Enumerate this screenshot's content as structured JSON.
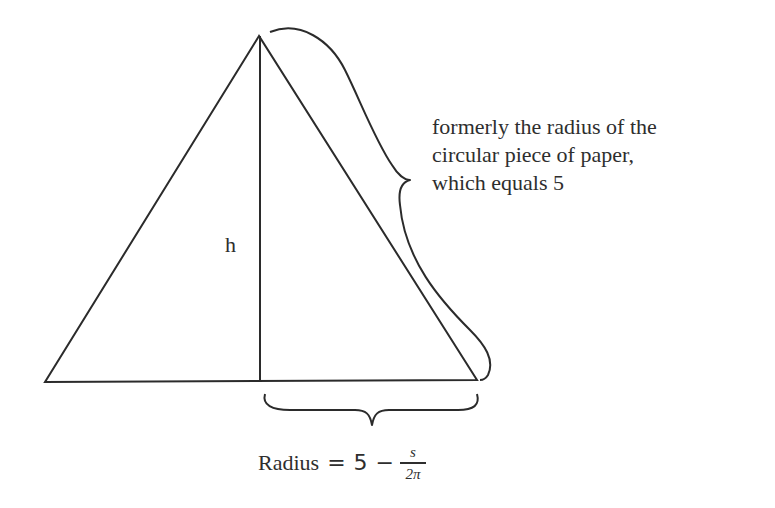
{
  "diagram": {
    "type": "cone-cross-section",
    "shape": "triangle",
    "stroke_color": "#2b2b2b",
    "height_label": "h",
    "slant_note": {
      "lines": [
        "formerly the radius of the",
        "circular piece of paper,",
        "which equals 5"
      ]
    },
    "radius_formula": {
      "lhs": "Radius",
      "equals": "=",
      "constant": "5",
      "operator": "−",
      "numerator": "s",
      "denominator": "2π"
    }
  }
}
